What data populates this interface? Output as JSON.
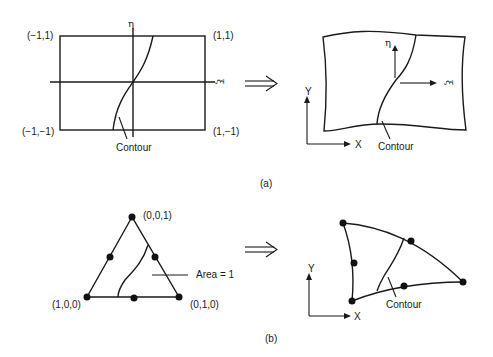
{
  "figure_a": {
    "caption": "(a)",
    "parent_element": {
      "corner_labels": {
        "top_left": "(−1,1)",
        "top_right": "(1,1)",
        "bottom_left": "(−1,−1)",
        "bottom_right": "(1,−1)"
      },
      "axis_eta": "η",
      "axis_xi": "ξ",
      "contour_label": "Contour"
    },
    "mapping_arrow": "⟹",
    "physical_element": {
      "axis_eta": "η",
      "axis_xi": "ξ",
      "global_axis_x": "X",
      "global_axis_y": "Y",
      "contour_label": "Contour"
    }
  },
  "figure_b": {
    "caption": "(b)",
    "parent_element": {
      "vertex_labels": {
        "top": "(0,0,1)",
        "bottom_left": "(1,0,0)",
        "bottom_right": "(0,1,0)"
      },
      "area_label": "Area = 1"
    },
    "mapping_arrow": "⟹",
    "physical_element": {
      "global_axis_x": "X",
      "global_axis_y": "Y",
      "contour_label": "Contour"
    }
  },
  "colors": {
    "ink": "#1a1a1a",
    "background": "#ffffff"
  }
}
